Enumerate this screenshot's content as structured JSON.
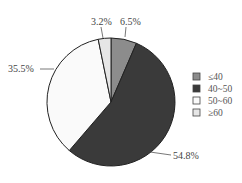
{
  "chart_data": {
    "type": "pie",
    "title": "",
    "categories": [
      "≤40",
      "40~50",
      "50~60",
      "≥60"
    ],
    "values": [
      6.5,
      54.8,
      35.5,
      3.2
    ],
    "value_labels": [
      "6.5%",
      "54.8%",
      "35.5%",
      "3.2%"
    ],
    "colors": [
      "#8c8c8c",
      "#3a3a3a",
      "#fafafa",
      "#e6e6e6"
    ],
    "start_angle": "top (12 o'clock)",
    "direction": "clockwise",
    "legend_position": "right"
  },
  "legend": {
    "items": [
      {
        "label": "≤40",
        "color": "#8c8c8c"
      },
      {
        "label": "40~50",
        "color": "#3a3a3a"
      },
      {
        "label": "50~60",
        "color": "#fafafa"
      },
      {
        "label": "≥60",
        "color": "#e6e6e6"
      }
    ]
  },
  "labels": {
    "s0": "6.5%",
    "s1": "54.8%",
    "s2": "35.5%",
    "s3": "3.2%"
  }
}
